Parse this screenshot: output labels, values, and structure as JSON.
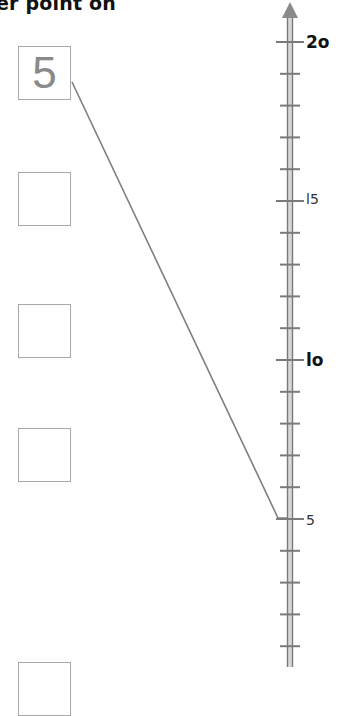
{
  "header": {
    "text": "er point on"
  },
  "boxes": [
    {
      "value": "5"
    },
    {
      "value": ""
    },
    {
      "value": ""
    },
    {
      "value": ""
    },
    {
      "value": ""
    }
  ],
  "number_line": {
    "orientation": "vertical",
    "direction": "up",
    "labels": [
      {
        "value": "20",
        "display": "2o"
      },
      {
        "value": "15",
        "display": "l5"
      },
      {
        "value": "10",
        "display": "lo"
      },
      {
        "value": "5",
        "display": "5"
      }
    ],
    "colors": {
      "axis": "#7a7a7a",
      "connector": "#808080",
      "box_border": "#a8a8a8"
    }
  },
  "connector": {
    "from_box": "5",
    "to_value": "5"
  }
}
